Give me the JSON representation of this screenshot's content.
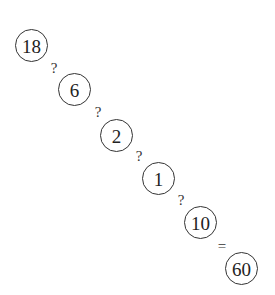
{
  "puzzle": {
    "nodes": [
      {
        "value": "18",
        "cx": 31,
        "cy": 45
      },
      {
        "value": "6",
        "cx": 74,
        "cy": 89
      },
      {
        "value": "2",
        "cx": 116,
        "cy": 135
      },
      {
        "value": "1",
        "cx": 158,
        "cy": 178
      },
      {
        "value": "10",
        "cx": 200,
        "cy": 222
      },
      {
        "value": "60",
        "cx": 241,
        "cy": 268
      }
    ],
    "operators": [
      {
        "symbol": "?",
        "cx": 54,
        "cy": 68
      },
      {
        "symbol": "?",
        "cx": 98,
        "cy": 112
      },
      {
        "symbol": "?",
        "cx": 139,
        "cy": 156
      },
      {
        "symbol": "?",
        "cx": 181,
        "cy": 200
      },
      {
        "symbol": "=",
        "cx": 222,
        "cy": 246
      }
    ]
  }
}
